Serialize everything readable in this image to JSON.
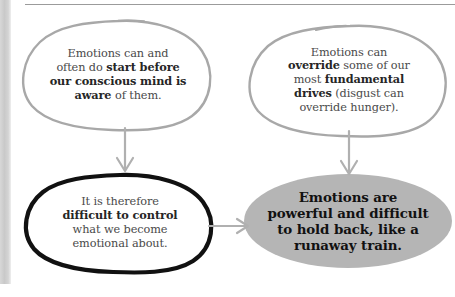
{
  "diagram": {
    "colors": {
      "sketch_outline": "#a8a8a8",
      "bold_outline": "#111111",
      "filled_node": "#b5b5b5",
      "arrow": "#b0b0b0",
      "body_text": "#4a4a4a",
      "bold_text": "#262626",
      "page_edge": "#cfcfcf",
      "top_rule": "#9b9b9b"
    },
    "nodes": [
      {
        "id": "top-left",
        "shape": "sketch-ellipse",
        "style": "outline-gray",
        "lines": [
          {
            "segments": [
              {
                "text": "Emotions can and",
                "bold": false
              }
            ]
          },
          {
            "segments": [
              {
                "text": "often do ",
                "bold": false
              },
              {
                "text": "start before",
                "bold": true
              }
            ]
          },
          {
            "segments": [
              {
                "text": "our conscious mind is",
                "bold": true
              }
            ]
          },
          {
            "segments": [
              {
                "text": "aware",
                "bold": true
              },
              {
                "text": " of them.",
                "bold": false
              }
            ]
          }
        ],
        "plain_text": "Emotions can and often do start before our conscious mind is aware of them."
      },
      {
        "id": "top-right",
        "shape": "sketch-ellipse",
        "style": "outline-gray",
        "lines": [
          {
            "segments": [
              {
                "text": "Emotions can",
                "bold": false
              }
            ]
          },
          {
            "segments": [
              {
                "text": "override",
                "bold": true
              },
              {
                "text": " some of our",
                "bold": false
              }
            ]
          },
          {
            "segments": [
              {
                "text": "most ",
                "bold": false
              },
              {
                "text": "fundamental",
                "bold": true
              }
            ]
          },
          {
            "segments": [
              {
                "text": "drives",
                "bold": true
              },
              {
                "text": " (disgust can",
                "bold": false
              }
            ]
          },
          {
            "segments": [
              {
                "text": "override hunger).",
                "bold": false
              }
            ]
          }
        ],
        "plain_text": "Emotions can override some of our most fundamental drives (disgust can override hunger)."
      },
      {
        "id": "bottom-left",
        "shape": "sketch-ellipse",
        "style": "outline-black-thick",
        "lines": [
          {
            "segments": [
              {
                "text": "It is therefore",
                "bold": false
              }
            ]
          },
          {
            "segments": [
              {
                "text": "difficult to control",
                "bold": true
              }
            ]
          },
          {
            "segments": [
              {
                "text": "what we become",
                "bold": false
              }
            ]
          },
          {
            "segments": [
              {
                "text": "emotional about.",
                "bold": false
              }
            ]
          }
        ],
        "plain_text": "It is therefore difficult to control what we become emotional about."
      },
      {
        "id": "bottom-right",
        "shape": "ellipse",
        "style": "filled-gray",
        "lines": [
          {
            "segments": [
              {
                "text": "Emotions are",
                "bold": true
              }
            ]
          },
          {
            "segments": [
              {
                "text": "powerful and difficult",
                "bold": true
              }
            ]
          },
          {
            "segments": [
              {
                "text": "to hold back, like a",
                "bold": true
              }
            ]
          },
          {
            "segments": [
              {
                "text": "runaway train.",
                "bold": true
              }
            ]
          }
        ],
        "plain_text": "Emotions are powerful and difficult to hold back, like a runaway train."
      }
    ],
    "arrows": [
      {
        "id": "arrow-down-left",
        "from": "top-left",
        "to": "bottom-left",
        "direction": "down"
      },
      {
        "id": "arrow-down-right",
        "from": "top-right",
        "to": "bottom-right",
        "direction": "down"
      },
      {
        "id": "arrow-right-bottom",
        "from": "bottom-left",
        "to": "bottom-right",
        "direction": "right"
      }
    ]
  }
}
